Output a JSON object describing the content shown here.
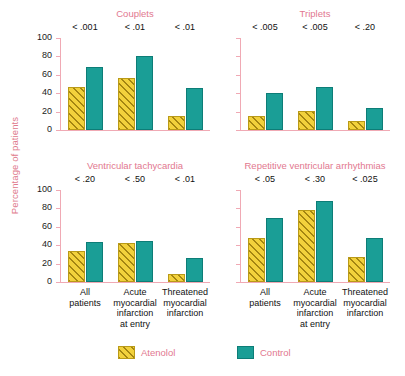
{
  "chart_data": {
    "type": "bar",
    "title": "",
    "ylabel": "Percentage of patients",
    "xlabel": "",
    "ylim": [
      0,
      100
    ],
    "yticks": [
      0,
      20,
      40,
      60,
      80,
      100
    ],
    "ytick_labels": [
      "0",
      "20",
      "40",
      "60",
      "80",
      "100"
    ],
    "grid": false,
    "legend_position": "bottom",
    "categories": [
      "All patients",
      "Acute myocardial infarction at entry",
      "Threatened myocardial infarction"
    ],
    "category_lines": [
      "All\npatients",
      "Acute\nmyocardial\ninfarction\nat entry",
      "Threatened\nmyocardial\ninfarction"
    ],
    "series_names": [
      "Atenolol",
      "Control"
    ],
    "series_colors": {
      "atenolol": "#f2d13c",
      "control": "#1a9e96"
    },
    "panels": [
      {
        "title": "Couplets",
        "annotations": [
          "< .001",
          "< .01",
          "< .01"
        ],
        "series": [
          {
            "name": "Atenolol",
            "values": [
              47,
              56,
              15
            ]
          },
          {
            "name": "Control",
            "values": [
              69,
              80,
              46
            ]
          }
        ]
      },
      {
        "title": "Triplets",
        "annotations": [
          "< .005",
          "< .005",
          "< .20"
        ],
        "series": [
          {
            "name": "Atenolol",
            "values": [
              15,
              21,
              10
            ]
          },
          {
            "name": "Control",
            "values": [
              40,
              47,
              24
            ]
          }
        ]
      },
      {
        "title": "Ventricular tachycardia",
        "annotations": [
          "< .20",
          "< .50",
          "< .01"
        ],
        "series": [
          {
            "name": "Atenolol",
            "values": [
              34,
              42,
              9
            ]
          },
          {
            "name": "Control",
            "values": [
              43,
              45,
              26
            ]
          }
        ]
      },
      {
        "title": "Repetitive ventricular arrhythmias",
        "annotations": [
          "< .05",
          "< .30",
          "< .025"
        ],
        "series": [
          {
            "name": "Atenolol",
            "values": [
              48,
              78,
              27
            ]
          },
          {
            "name": "Control",
            "values": [
              70,
              88,
              48
            ]
          }
        ]
      }
    ]
  },
  "legend": {
    "atenolol_label": "Atenolol",
    "control_label": "Control"
  },
  "axis": {
    "ylabel": "Percentage of patients"
  }
}
